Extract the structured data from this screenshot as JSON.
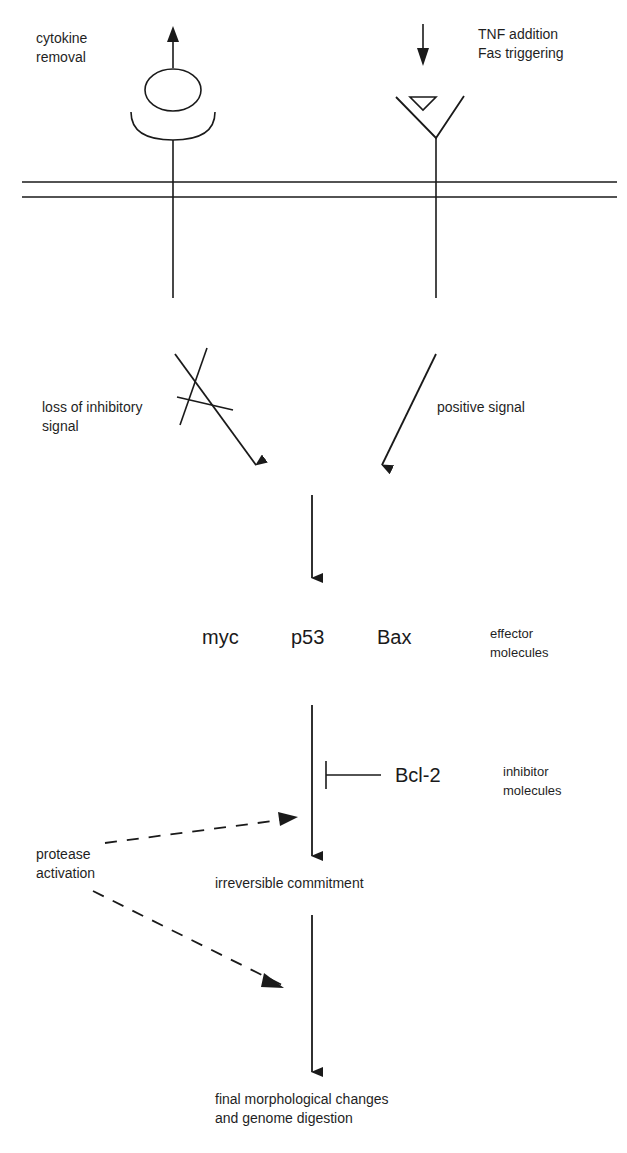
{
  "diagram": {
    "top_left": {
      "line1": "cytokine",
      "line2": "removal"
    },
    "top_right": {
      "line1": "TNF addition",
      "line2": "Fas triggering"
    },
    "left_signal": {
      "line1": "loss of inhibitory",
      "line2": "signal"
    },
    "right_signal": {
      "line1": "positive signal"
    },
    "effectors": {
      "items": [
        "myc",
        "p53",
        "Bax"
      ],
      "caption": {
        "line1": "effector",
        "line2": "molecules"
      }
    },
    "inhibitors": {
      "item": "Bcl-2",
      "caption": {
        "line1": "inhibitor",
        "line2": "molecules"
      }
    },
    "protease": {
      "line1": "protease",
      "line2": "activation"
    },
    "commitment": "irreversible commitment",
    "final": {
      "line1": "final morphological changes",
      "line2": "and genome digestion"
    },
    "colors": {
      "ink": "#1a1a1a",
      "background": "#ffffff"
    }
  }
}
